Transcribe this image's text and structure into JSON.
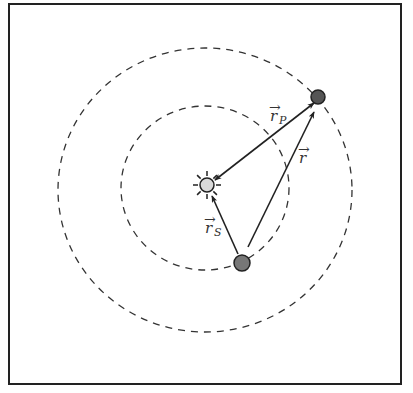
{
  "diagram": {
    "type": "orbital-vector-diagram",
    "colors": {
      "frame": "#222222",
      "orbit": "#333333",
      "vector": "#222222",
      "sun_fill": "#d9d9d9",
      "planet_fill": "#555555",
      "star_fill": "#777777",
      "label": "#333333",
      "background": "#ffffff"
    },
    "frame": {
      "x": 9,
      "y": 4,
      "width": 392,
      "height": 380
    },
    "orbits": [
      {
        "name": "outer-orbit",
        "cx": 205,
        "cy": 190,
        "rx": 147,
        "ry": 142
      },
      {
        "name": "inner-orbit",
        "cx": 205,
        "cy": 188,
        "rx": 84,
        "ry": 82
      }
    ],
    "bodies": {
      "sun": {
        "cx": 207,
        "cy": 185,
        "r": 7,
        "ray_inner": 9,
        "ray_outer": 14
      },
      "planet": {
        "cx": 318,
        "cy": 97,
        "r": 7
      },
      "star": {
        "cx": 242,
        "cy": 263,
        "r": 8
      }
    },
    "vectors": [
      {
        "name": "r_P",
        "x1": 314,
        "y1": 103,
        "x2": 215,
        "y2": 180,
        "double_headed": true
      },
      {
        "name": "r",
        "x1": 248,
        "y1": 247,
        "x2": 314,
        "y2": 112,
        "double_headed": false
      },
      {
        "name": "r_S",
        "x1": 238,
        "y1": 254,
        "x2": 212,
        "y2": 196,
        "double_headed": false
      }
    ],
    "labels": {
      "r_P": {
        "main": "r",
        "arrow": "→",
        "sub": "P",
        "x": 270,
        "y": 121
      },
      "r": {
        "main": "r",
        "arrow": "→",
        "x": 299,
        "y": 163
      },
      "r_S": {
        "main": "r",
        "arrow": "→",
        "sub": "S",
        "x": 205,
        "y": 233
      }
    }
  }
}
